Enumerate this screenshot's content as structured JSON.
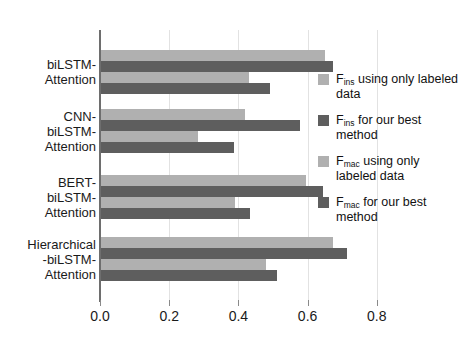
{
  "chart_data": {
    "type": "bar",
    "orientation": "horizontal",
    "title": "",
    "xlabel": "",
    "ylabel": "",
    "xlim": [
      0.0,
      0.9
    ],
    "xticks": [
      0.0,
      0.2,
      0.4,
      0.6,
      0.8
    ],
    "xtick_labels": [
      "0.0",
      "0.2",
      "0.4",
      "0.6",
      "0.8"
    ],
    "grid": true,
    "grid_axis": "x",
    "legend_position": "right",
    "categories": [
      "biLSTM-\nAttention",
      "CNN-\nbiLSTM-\nAttention",
      "BERT-\nbiLSTM-\nAttention",
      "Hierarchical\n-biLSTM-\nAttention"
    ],
    "series": [
      {
        "name": "F_ins using only labeled data",
        "label_main": "F",
        "label_sub": "ins",
        "label_rest": " using only labeled data",
        "color": "#b0b0b0",
        "values": [
          0.65,
          0.42,
          0.595,
          0.673
        ]
      },
      {
        "name": "F_ins for our best method",
        "label_main": "F",
        "label_sub": "ins",
        "label_rest": " for our best method",
        "color": "#5e5e5e",
        "values": [
          0.673,
          0.578,
          0.644,
          0.713
        ]
      },
      {
        "name": "F_mac using only labeled data",
        "label_main": "F",
        "label_sub": "mac",
        "label_rest": " using only labeled data",
        "color": "#b0b0b0",
        "values": [
          0.43,
          0.283,
          0.39,
          0.48
        ]
      },
      {
        "name": "F_mac for our best method",
        "label_main": "F",
        "label_sub": "mac",
        "label_rest": " for our best method",
        "color": "#5e5e5e",
        "values": [
          0.49,
          0.387,
          0.434,
          0.512
        ]
      }
    ]
  },
  "legend": {
    "items": [
      {
        "swatch": "light",
        "main": "F",
        "sub": "ins",
        "rest": " using only labeled data"
      },
      {
        "swatch": "dark",
        "main": "F",
        "sub": "ins",
        "rest": " for our best method"
      },
      {
        "swatch": "light",
        "main": "F",
        "sub": "mac",
        "rest": " using only labeled data"
      },
      {
        "swatch": "dark",
        "main": "F",
        "sub": "mac",
        "rest": " for our best method"
      }
    ]
  },
  "colors": {
    "light_bar": "#b0b0b0",
    "dark_bar": "#5e5e5e",
    "gridline": "#e2e2e2",
    "axis": "#6e6e6e",
    "background": "#ffffff",
    "text": "#1a1a1a"
  }
}
